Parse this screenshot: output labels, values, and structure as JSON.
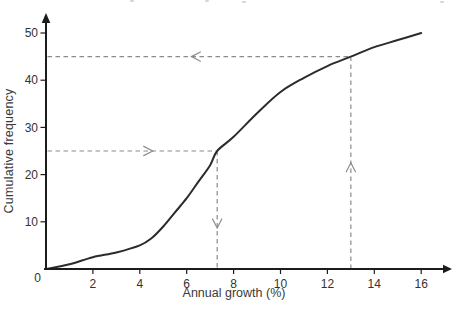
{
  "chart_data": {
    "type": "line",
    "title": "",
    "xlabel": "Annual growth (%)",
    "ylabel": "Cumulative frequency",
    "origin_label": "0",
    "x_tick_labels": [
      2,
      4,
      6,
      8,
      10,
      12,
      14,
      16
    ],
    "y_tick_labels": [
      10,
      20,
      30,
      40,
      50
    ],
    "xlim": [
      0,
      17.2
    ],
    "ylim": [
      0,
      54
    ],
    "grid": false,
    "axis_color": "#1c1c1c",
    "text_color": "#333333",
    "series": [
      {
        "name": "cumulative-frequency-ogive",
        "color": "#2b2b2b",
        "x": [
          0,
          1,
          2,
          3,
          4,
          4.5,
          5,
          5.5,
          6,
          6.5,
          7,
          7.3,
          8,
          9,
          10,
          11,
          12,
          13,
          14,
          15,
          16
        ],
        "y": [
          0,
          1,
          2.5,
          3.5,
          5,
          6.5,
          9,
          12,
          15,
          18.5,
          22,
          25,
          28,
          33,
          37.5,
          40.5,
          43,
          45,
          47,
          48.5,
          50
        ]
      }
    ],
    "guides": {
      "color": "#8c8c8c",
      "items": [
        {
          "kind": "horizontal",
          "y": 45,
          "from_x": 0,
          "to_x": 13,
          "arrow": "left",
          "arrow_at_x": 6.2
        },
        {
          "kind": "horizontal",
          "y": 25,
          "from_x": 0,
          "to_x": 7.3,
          "arrow": "right",
          "arrow_at_x": 4.55
        },
        {
          "kind": "vertical",
          "x": 7.3,
          "from_y": 25,
          "to_y": 0,
          "arrow": "down",
          "arrow_at_y": 8.7
        },
        {
          "kind": "vertical",
          "x": 13,
          "from_y": 0,
          "to_y": 45,
          "arrow": "up",
          "arrow_at_y": 22.5
        }
      ]
    }
  }
}
